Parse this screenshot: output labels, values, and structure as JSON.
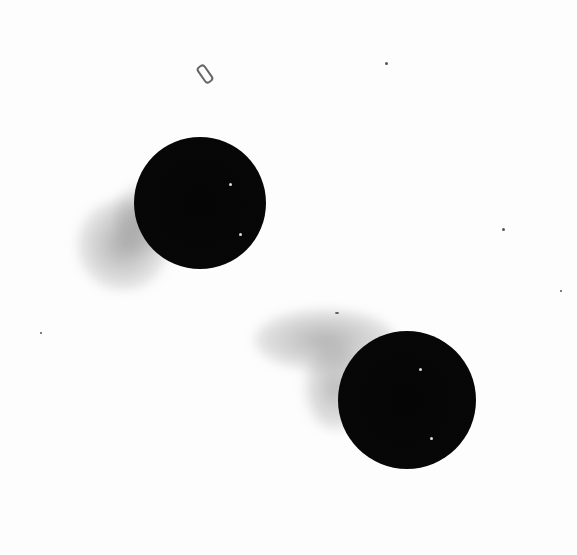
{
  "image": {
    "description": "Two dark spherical particles with wispy gray trails on a white background",
    "background_color": "#fdfdfd",
    "objects": [
      {
        "type": "sphere",
        "cx": 200,
        "cy": 203,
        "r": 64,
        "color": "#050505"
      },
      {
        "type": "sphere",
        "cx": 407,
        "cy": 400,
        "r": 67,
        "color": "#050505"
      }
    ],
    "trails": [
      {
        "near": "upper-left sphere",
        "direction": "lower-left",
        "color": "#9a9a9a"
      },
      {
        "near": "lower-right sphere",
        "direction": "upper-left",
        "color": "#9a9a9a"
      }
    ],
    "debris": [
      {
        "x": 204,
        "y": 72
      }
    ]
  }
}
